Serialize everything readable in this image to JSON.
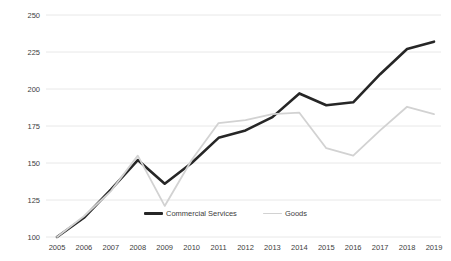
{
  "chart_data": {
    "type": "line",
    "title": "",
    "xlabel": "",
    "ylabel": "",
    "categories": [
      "2005",
      "2006",
      "2007",
      "2008",
      "2009",
      "2010",
      "2011",
      "2012",
      "2013",
      "2014",
      "2015",
      "2016",
      "2017",
      "2018",
      "2019"
    ],
    "series": [
      {
        "name": "Commercial Services",
        "color": "#262626",
        "stroke_width": 2.6,
        "values": [
          100,
          113,
          132,
          152,
          136,
          150,
          167,
          172,
          181,
          197,
          189,
          191,
          210,
          227,
          232
        ]
      },
      {
        "name": "Goods",
        "color": "#d2d2d2",
        "stroke_width": 1.8,
        "values": [
          100,
          114,
          131,
          155,
          121,
          152,
          177,
          179,
          183,
          184,
          160,
          155,
          172,
          188,
          183
        ]
      }
    ],
    "ylim": [
      100,
      250
    ],
    "yticks": [
      100,
      125,
      150,
      175,
      200,
      225,
      250
    ],
    "grid": "horizontal",
    "gridline_color": "#e8e8e8",
    "axis_text_color": "#404040",
    "background": "#ffffff",
    "legend_position": "bottom-center-inside"
  }
}
